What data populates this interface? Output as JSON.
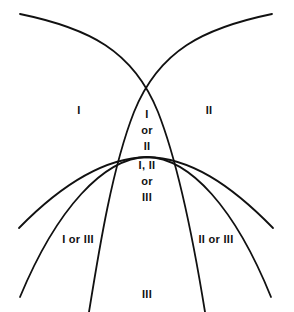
{
  "figure": {
    "type": "venn-like-arc-diagram",
    "background_color": "#ffffff",
    "stroke_color": "#111111",
    "stroke_width": 1.8,
    "width": 294,
    "height": 312
  },
  "arcs": [
    {
      "name": "upper-left-arc",
      "start": [
        20,
        14
      ],
      "end": [
        205,
        312
      ],
      "description": "concave-down arc from top-left sweeping to bottom-right"
    },
    {
      "name": "upper-right-arc",
      "start": [
        272,
        14
      ],
      "end": [
        89,
        312
      ],
      "description": "concave-down arc from top-right sweeping to bottom-left"
    },
    {
      "name": "lower-left-arc",
      "start": [
        19,
        228
      ],
      "end": [
        271,
        297
      ],
      "description": "concave-down arc across the lower half, left to right"
    },
    {
      "name": "lower-right-arc",
      "start": [
        20,
        297
      ],
      "end": [
        273,
        228
      ],
      "description": "concave-down arc across the lower half, right to left"
    }
  ],
  "crossings": {
    "top_lens_apex": [
      146,
      88
    ],
    "bottom_lens_apex": [
      147,
      235
    ],
    "mid_band_y": 157
  },
  "labels": [
    {
      "id": "region-i",
      "text": "I",
      "lines": [
        "I"
      ],
      "x": 79,
      "y": 110
    },
    {
      "id": "region-ii",
      "text": "II",
      "lines": [
        "II"
      ],
      "x": 209,
      "y": 110
    },
    {
      "id": "region-i-or-ii",
      "text": "I or II",
      "lines": [
        "I",
        "or",
        "II"
      ],
      "x": 147,
      "y": 130
    },
    {
      "id": "region-i-ii-or-iii",
      "text": "I, II or III",
      "lines": [
        "I, II",
        "or",
        "III"
      ],
      "x": 147,
      "y": 181
    },
    {
      "id": "region-i-or-iii",
      "text": "I or III",
      "lines": [
        "I or III"
      ],
      "x": 78,
      "y": 239
    },
    {
      "id": "region-ii-or-iii",
      "text": "II or III",
      "lines": [
        "II or III"
      ],
      "x": 216,
      "y": 239
    },
    {
      "id": "region-iii",
      "text": "III",
      "lines": [
        "III"
      ],
      "x": 147,
      "y": 294
    }
  ]
}
